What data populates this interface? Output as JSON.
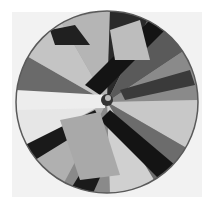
{
  "image": {
    "subject": "Paper umbrella viewed from above with geometric grayscale pattern",
    "palette": {
      "background": "#ffffff",
      "panel": "#f2f2f2",
      "dark": "#141414",
      "mid": "#7a7a7a",
      "light": "#d8d8d8",
      "rim": "#5a5a5a"
    },
    "center": {
      "x": 107,
      "y": 102
    },
    "radius": 91
  }
}
